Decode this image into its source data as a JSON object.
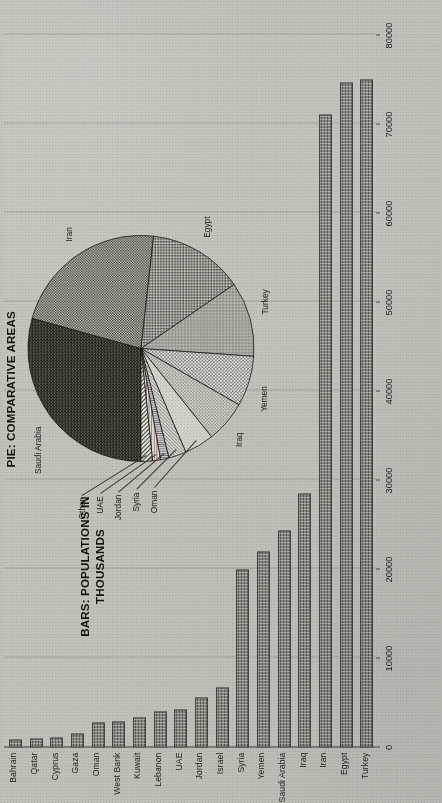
{
  "figure": {
    "bars_title_line1": "BARS: POPULATIONS IN",
    "bars_title_line2": "THOUSANDS",
    "pie_title": "PIE: COMPARATIVE AREAS"
  },
  "chart_data": [
    {
      "type": "bar",
      "title": "BARS: POPULATIONS IN THOUSANDS",
      "orientation": "horizontal",
      "xlabel": "",
      "ylabel": "",
      "xlim": [
        0,
        80000
      ],
      "xticks": [
        "0",
        "10000",
        "20000",
        "30000",
        "40000",
        "50000",
        "60000",
        "70000",
        "80000"
      ],
      "grid": true,
      "categories": [
        "Bahrain",
        "Qatar",
        "Cyprus",
        "Gaza",
        "Oman",
        "West Bank",
        "Kuwait",
        "Lebanon",
        "UAE",
        "Jordan",
        "Israel",
        "Syria",
        "Yemen",
        "Saudi Arabia",
        "Iraq",
        "Iran",
        "Egypt",
        "Turkey"
      ],
      "values": [
        700,
        800,
        900,
        1300,
        2600,
        2700,
        3200,
        3800,
        4100,
        5400,
        6500,
        19800,
        21800,
        24200,
        28300,
        70900,
        74500,
        74800
      ]
    },
    {
      "type": "pie",
      "title": "PIE: COMPARATIVE AREAS",
      "labels": [
        "Saudi Arabia",
        "Iran",
        "Egypt",
        "Turkey",
        "Yemen",
        "Iraq",
        "Oman",
        "Syria",
        "Jordan",
        "UAE",
        "Other"
      ],
      "values": [
        2150000,
        1648000,
        1001000,
        784000,
        528000,
        438000,
        310000,
        185000,
        89000,
        83000,
        120000
      ],
      "legend_position": "callout-labels"
    }
  ],
  "bars": {
    "axis_ticks": [
      "0",
      "10000",
      "20000",
      "30000",
      "40000",
      "50000",
      "60000",
      "70000",
      "80000"
    ],
    "items": [
      {
        "label": "Bahrain",
        "value": 700
      },
      {
        "label": "Qatar",
        "value": 800
      },
      {
        "label": "Cyprus",
        "value": 900
      },
      {
        "label": "Gaza",
        "value": 1300
      },
      {
        "label": "Oman",
        "value": 2600
      },
      {
        "label": "West Bank",
        "value": 2700
      },
      {
        "label": "Kuwait",
        "value": 3200
      },
      {
        "label": "Lebanon",
        "value": 3800
      },
      {
        "label": "UAE",
        "value": 4100
      },
      {
        "label": "Jordan",
        "value": 5400
      },
      {
        "label": "Israel",
        "value": 6500
      },
      {
        "label": "Syria",
        "value": 19800
      },
      {
        "label": "Yemen",
        "value": 21800
      },
      {
        "label": "Saudi Arabia",
        "value": 24200
      },
      {
        "label": "Iraq",
        "value": 28300
      },
      {
        "label": "Iran",
        "value": 70900
      },
      {
        "label": "Egypt",
        "value": 74500
      },
      {
        "label": "Turkey",
        "value": 74800
      }
    ]
  },
  "pie": {
    "slices": [
      {
        "label": "Saudi Arabia",
        "value": 2150000
      },
      {
        "label": "Iran",
        "value": 1648000
      },
      {
        "label": "Egypt",
        "value": 1001000
      },
      {
        "label": "Turkey",
        "value": 784000
      },
      {
        "label": "Yemen",
        "value": 528000
      },
      {
        "label": "Iraq",
        "value": 438000
      },
      {
        "label": "Oman",
        "value": 310000
      },
      {
        "label": "Syria",
        "value": 185000
      },
      {
        "label": "Jordan",
        "value": 89000
      },
      {
        "label": "UAE",
        "value": 83000
      },
      {
        "label": "Other",
        "value": 120000
      }
    ]
  },
  "colors": {
    "paper": "#d4d4cf",
    "ink": "#1d1d1b",
    "grid": "#b2b2ad",
    "axis": "#6f6f6b",
    "bar_fill": "#9a9a95"
  }
}
